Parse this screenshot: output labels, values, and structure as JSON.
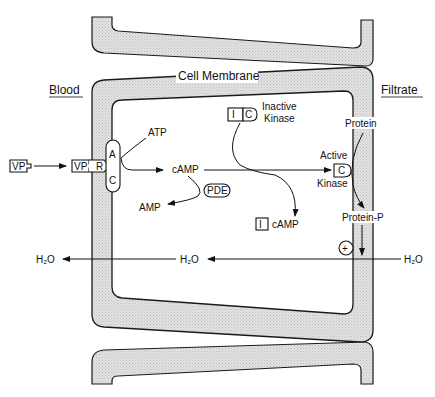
{
  "diagram": {
    "regions": {
      "left": "Blood",
      "right": "Filtrate",
      "membrane": "Cell Membrane"
    },
    "labels": {
      "vp_free": "VP",
      "vp_bound": "VP",
      "receptor": "R",
      "cyclase_a": "A",
      "cyclase_c": "C",
      "atp": "ATP",
      "camp": "cAMP",
      "pde": "PDE",
      "amp": "AMP",
      "inactive_i": "I",
      "inactive_c": "C",
      "inactive_line1": "Inactive",
      "inactive_line2": "Kinase",
      "released_i": "I",
      "released_camp": "cAMP",
      "active_line1": "Active",
      "active_c": "C",
      "active_line2": "Kinase",
      "protein": "Protein",
      "protein_p": "Protein-P",
      "plus": "+",
      "h2o_right": "H₂O",
      "h2o_mid": "H₂O",
      "h2o_left": "H₂O"
    },
    "colors": {
      "membrane_fill": "#dcdcdc",
      "stroke": "#1a1a1a"
    }
  }
}
